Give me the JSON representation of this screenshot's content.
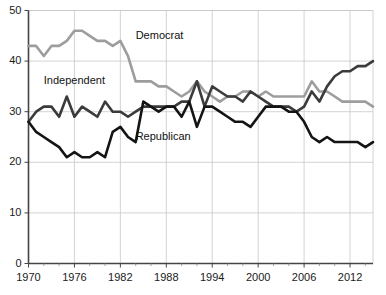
{
  "chart_data": {
    "type": "line",
    "title": "",
    "subtitle": "",
    "xlabel": "",
    "ylabel": "",
    "xlim": [
      1970,
      2015
    ],
    "ylim": [
      0,
      50
    ],
    "grid": true,
    "legend_position": "inline-annotations",
    "xticks": [
      "1970",
      "1976",
      "1982",
      "1988",
      "1994",
      "2000",
      "2006",
      "2012"
    ],
    "xtick_values": [
      1970,
      1976,
      1982,
      1988,
      1994,
      2000,
      2006,
      2012
    ],
    "yticks": [
      "0",
      "10",
      "20",
      "30",
      "40",
      "50"
    ],
    "ytick_values": [
      0,
      10,
      20,
      30,
      40,
      50
    ],
    "x": [
      1970,
      1971,
      1972,
      1973,
      1974,
      1975,
      1976,
      1977,
      1978,
      1979,
      1980,
      1981,
      1982,
      1983,
      1984,
      1985,
      1986,
      1987,
      1988,
      1989,
      1990,
      1991,
      1992,
      1993,
      1994,
      1995,
      1996,
      1997,
      1998,
      1999,
      2000,
      2001,
      2002,
      2003,
      2004,
      2005,
      2006,
      2007,
      2008,
      2009,
      2010,
      2011,
      2012,
      2013,
      2014,
      2015
    ],
    "series": [
      {
        "name": "Democrat",
        "color": "#9d9d9d",
        "label_x": 1984,
        "label_y": 45,
        "values": [
          43,
          43,
          41,
          43,
          43,
          44,
          46,
          46,
          45,
          44,
          44,
          43,
          44,
          41,
          36,
          36,
          36,
          35,
          35,
          34,
          33,
          34,
          36,
          34,
          33,
          32,
          33,
          33,
          34,
          34,
          33,
          34,
          33,
          33,
          33,
          33,
          33,
          36,
          34,
          34,
          33,
          32,
          32,
          32,
          32,
          31
        ]
      },
      {
        "name": "Independent",
        "color": "#3b3b3b",
        "label_x": 1972,
        "label_y": 36,
        "values": [
          28,
          30,
          31,
          31,
          29,
          33,
          29,
          31,
          30,
          29,
          32,
          30,
          30,
          29,
          30,
          31,
          31,
          31,
          31,
          31,
          32,
          32,
          36,
          31,
          35,
          34,
          33,
          33,
          32,
          34,
          33,
          32,
          31,
          31,
          31,
          30,
          31,
          34,
          32,
          35,
          37,
          38,
          38,
          39,
          39,
          40
        ]
      },
      {
        "name": "Republican",
        "color": "#141414",
        "label_x": 1984,
        "label_y": 25,
        "values": [
          28,
          26,
          25,
          24,
          23,
          21,
          22,
          21,
          21,
          22,
          21,
          26,
          27,
          25,
          24,
          32,
          31,
          30,
          31,
          31,
          29,
          32,
          27,
          31,
          31,
          30,
          29,
          28,
          28,
          27,
          29,
          31,
          31,
          31,
          30,
          30,
          28,
          25,
          24,
          25,
          24,
          24,
          24,
          24,
          23,
          24
        ]
      }
    ]
  },
  "axes": {
    "x_axis_name": "year-axis",
    "y_axis_name": "percent-axis"
  }
}
